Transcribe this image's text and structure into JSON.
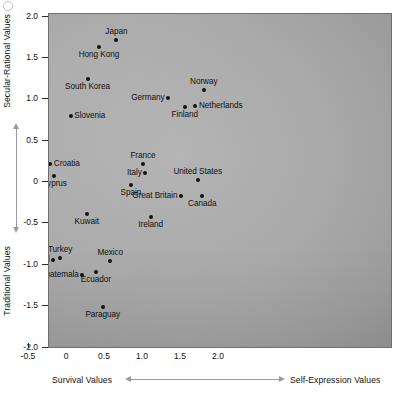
{
  "chart_data": {
    "type": "scatter",
    "title": "",
    "xlabel_left": "Survival Values",
    "xlabel_right": "Self-Expression Values",
    "ylabel_top": "Secular-Rational Values",
    "ylabel_bottom": "Traditional Values",
    "xlim": [
      -2.35,
      2.3
    ],
    "ylim": [
      -2.2,
      2.05
    ],
    "grid": false,
    "legend": null,
    "xticks": [
      -2.0,
      -1.5,
      -1.0,
      -0.5,
      0,
      0.5,
      1.0,
      1.5,
      2.0
    ],
    "xticklabels": [
      "-2.0",
      "-1.5",
      "-1.0",
      "-0.5",
      "0",
      "0.5",
      "1.0",
      "1.5",
      "2.0"
    ],
    "yticks": [
      2.0,
      1.5,
      1.0,
      0.5,
      0,
      -0.5,
      -1.0,
      -1.5,
      -2.0
    ],
    "yticklabels": [
      "2.0",
      "1.5",
      "1.0",
      "0.5",
      "0",
      "-0.5",
      "-1.0",
      "-1.5",
      "-2.0"
    ],
    "points": [
      {
        "label": "Japan",
        "x": 0.65,
        "y": 1.72,
        "pos": "above"
      },
      {
        "label": "Hong Kong",
        "x": 0.42,
        "y": 1.63,
        "pos": "below"
      },
      {
        "label": "China",
        "x": -1.16,
        "y": 1.33,
        "pos": "above"
      },
      {
        "label": "South Korea",
        "x": 0.27,
        "y": 1.24,
        "pos": "below"
      },
      {
        "label": "Norway",
        "x": 1.8,
        "y": 1.11,
        "pos": "above"
      },
      {
        "label": "Russia",
        "x": -1.53,
        "y": 1.07,
        "pos": "above"
      },
      {
        "label": "Germany",
        "x": 1.33,
        "y": 1.02,
        "pos": "left"
      },
      {
        "label": "Netherlands",
        "x": 1.69,
        "y": 0.92,
        "pos": "right"
      },
      {
        "label": "Ukraine",
        "x": -1.54,
        "y": 0.94,
        "pos": "below"
      },
      {
        "label": "Lithuania",
        "x": -0.79,
        "y": 0.93,
        "pos": "right"
      },
      {
        "label": "Finland",
        "x": 1.55,
        "y": 0.91,
        "pos": "below"
      },
      {
        "label": "Slovenia",
        "x": 0.05,
        "y": 0.8,
        "pos": "right"
      },
      {
        "label": "Moldova",
        "x": -1.55,
        "y": 0.68,
        "pos": "below"
      },
      {
        "label": "Slovakia",
        "x": -0.44,
        "y": 0.47,
        "pos": "left"
      },
      {
        "label": "France",
        "x": 1.0,
        "y": 0.22,
        "pos": "above"
      },
      {
        "label": "Croatia",
        "x": -0.22,
        "y": 0.22,
        "pos": "right"
      },
      {
        "label": "Hungary",
        "x": -0.29,
        "y": 0.21,
        "pos": "left"
      },
      {
        "label": "Kazakhstan",
        "x": -1.63,
        "y": 0.2,
        "pos": "below"
      },
      {
        "label": "Italy",
        "x": 1.03,
        "y": 0.11,
        "pos": "left"
      },
      {
        "label": "Cyprus",
        "x": -0.17,
        "y": 0.07,
        "pos": "below"
      },
      {
        "label": "Romania",
        "x": -1.03,
        "y": 0.04,
        "pos": "above"
      },
      {
        "label": "United States",
        "x": 1.72,
        "y": 0.03,
        "pos": "above"
      },
      {
        "label": "Spain",
        "x": 0.84,
        "y": -0.04,
        "pos": "below"
      },
      {
        "label": "Great Britain",
        "x": 1.5,
        "y": -0.17,
        "pos": "left"
      },
      {
        "label": "Canada",
        "x": 1.78,
        "y": -0.17,
        "pos": "below"
      },
      {
        "label": "Kyrgyzstan",
        "x": -1.7,
        "y": -0.23,
        "pos": "below"
      },
      {
        "label": "Kuwait",
        "x": 0.26,
        "y": -0.39,
        "pos": "below"
      },
      {
        "label": "Ireland",
        "x": 1.1,
        "y": -0.42,
        "pos": "below"
      },
      {
        "label": "Cuba",
        "x": -0.37,
        "y": -0.53,
        "pos": "above"
      },
      {
        "label": "Malaysia",
        "x": -0.39,
        "y": -0.71,
        "pos": "left"
      },
      {
        "label": "Turkey",
        "x": -0.09,
        "y": -0.92,
        "pos": "above"
      },
      {
        "label": "Mexico",
        "x": 0.57,
        "y": -0.95,
        "pos": "above"
      },
      {
        "label": "Thailand",
        "x": -0.18,
        "y": -0.94,
        "pos": "left"
      },
      {
        "label": "Pakistan",
        "x": -0.7,
        "y": -1.03,
        "pos": "left"
      },
      {
        "label": "India",
        "x": -0.63,
        "y": -1.05,
        "pos": "right"
      },
      {
        "label": "Guatemala",
        "x": 0.2,
        "y": -1.12,
        "pos": "left"
      },
      {
        "label": "Ecuador",
        "x": 0.38,
        "y": -1.09,
        "pos": "below"
      },
      {
        "label": "Bangladesh",
        "x": -0.95,
        "y": -1.13,
        "pos": "below"
      },
      {
        "label": "Egypt",
        "x": -0.64,
        "y": -1.16,
        "pos": "below"
      },
      {
        "label": "Yemen",
        "x": -0.68,
        "y": -1.28,
        "pos": "below"
      },
      {
        "label": "Paraguay",
        "x": 0.47,
        "y": -1.51,
        "pos": "below"
      },
      {
        "label": "Angola",
        "x": -0.82,
        "y": -1.76,
        "pos": "left"
      },
      {
        "label": "Ethiopia",
        "x": -0.74,
        "y": -1.82,
        "pos": "below"
      }
    ]
  }
}
